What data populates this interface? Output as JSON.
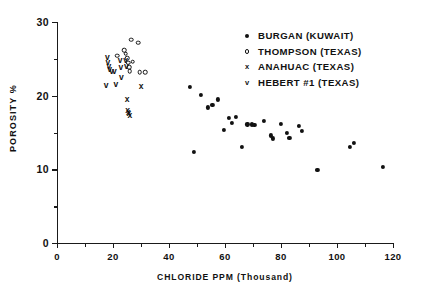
{
  "chart_data": {
    "type": "scatter",
    "title": "",
    "xlabel": "CHLORIDE PPM (Thousand)",
    "ylabel": "POROSITY %",
    "xlim": [
      0,
      120
    ],
    "ylim": [
      0,
      30
    ],
    "xticks": [
      0,
      20,
      40,
      60,
      80,
      100,
      120
    ],
    "xticks_minor": [
      10,
      30,
      50,
      70,
      90,
      110
    ],
    "yticks": [
      0,
      10,
      20,
      30
    ],
    "yticks_minor": [
      5,
      15,
      25
    ],
    "grid": false,
    "legend_position": "top-right",
    "series": [
      {
        "name": "BURGAN (KUWAIT)",
        "marker": "filled-circle",
        "color": "#111111",
        "points": [
          [
            47.5,
            21.2
          ],
          [
            49.0,
            12.4
          ],
          [
            51.5,
            20.1
          ],
          [
            54.0,
            18.4
          ],
          [
            55.5,
            18.7
          ],
          [
            57.5,
            19.5
          ],
          [
            59.5,
            15.3
          ],
          [
            61.5,
            17.0
          ],
          [
            62.5,
            16.3
          ],
          [
            64.0,
            17.1
          ],
          [
            66.0,
            13.0
          ],
          [
            68.0,
            16.1
          ],
          [
            69.5,
            16.1
          ],
          [
            70.5,
            16.0
          ],
          [
            74.0,
            16.6
          ],
          [
            76.5,
            14.6
          ],
          [
            77.0,
            14.2
          ],
          [
            80.0,
            16.2
          ],
          [
            82.0,
            14.9
          ],
          [
            83.0,
            14.3
          ],
          [
            86.5,
            15.9
          ],
          [
            87.5,
            15.2
          ],
          [
            93.0,
            9.9
          ],
          [
            104.5,
            13.0
          ],
          [
            106.0,
            13.6
          ],
          [
            116.5,
            10.3
          ]
        ]
      },
      {
        "name": "THOMPSON (TEXAS)",
        "marker": "open-circle",
        "color": "#111111",
        "points": [
          [
            21.5,
            25.4
          ],
          [
            24.0,
            26.2
          ],
          [
            24.5,
            25.7
          ],
          [
            25.0,
            25.1
          ],
          [
            25.5,
            24.5
          ],
          [
            25.8,
            23.9
          ],
          [
            26.0,
            23.3
          ],
          [
            26.5,
            27.6
          ],
          [
            27.0,
            24.6
          ],
          [
            29.0,
            27.2
          ],
          [
            29.5,
            23.2
          ],
          [
            31.5,
            23.2
          ]
        ]
      },
      {
        "name": "ANAHUAC (TEXAS)",
        "marker": "x",
        "color": "#111111",
        "points": [
          [
            25.0,
            19.5
          ],
          [
            25.2,
            18.0
          ],
          [
            25.5,
            17.8
          ],
          [
            25.7,
            17.6
          ],
          [
            26.0,
            17.4
          ],
          [
            30.0,
            21.3
          ]
        ]
      },
      {
        "name": "HEBERT #1 (TEXAS)",
        "marker": "v",
        "color": "#111111",
        "points": [
          [
            18.0,
            25.3
          ],
          [
            18.2,
            24.6
          ],
          [
            18.5,
            24.0
          ],
          [
            18.8,
            23.6
          ],
          [
            19.5,
            23.4
          ],
          [
            20.5,
            23.3
          ],
          [
            22.5,
            24.9
          ],
          [
            22.8,
            23.9
          ],
          [
            23.0,
            22.5
          ],
          [
            24.5,
            24.9
          ],
          [
            24.8,
            24.0
          ],
          [
            17.5,
            21.5
          ],
          [
            21.0,
            21.6
          ]
        ]
      }
    ]
  },
  "axes": {
    "y_title": "POROSITY %",
    "x_title": "CHLORIDE PPM (Thousand)",
    "y_tick_labels": [
      "0",
      "10",
      "20",
      "30"
    ],
    "x_tick_labels": [
      "0",
      "20",
      "40",
      "60",
      "80",
      "100",
      "120"
    ]
  },
  "legend": {
    "entries": [
      {
        "label": "BURGAN (KUWAIT)",
        "marker": "filled-circle",
        "glyph": ""
      },
      {
        "label": "THOMPSON (TEXAS)",
        "marker": "open-circle",
        "glyph": ""
      },
      {
        "label": "ANAHUAC (TEXAS)",
        "marker": "x",
        "glyph": "x"
      },
      {
        "label": "HEBERT #1 (TEXAS)",
        "marker": "v",
        "glyph": "v"
      }
    ]
  }
}
